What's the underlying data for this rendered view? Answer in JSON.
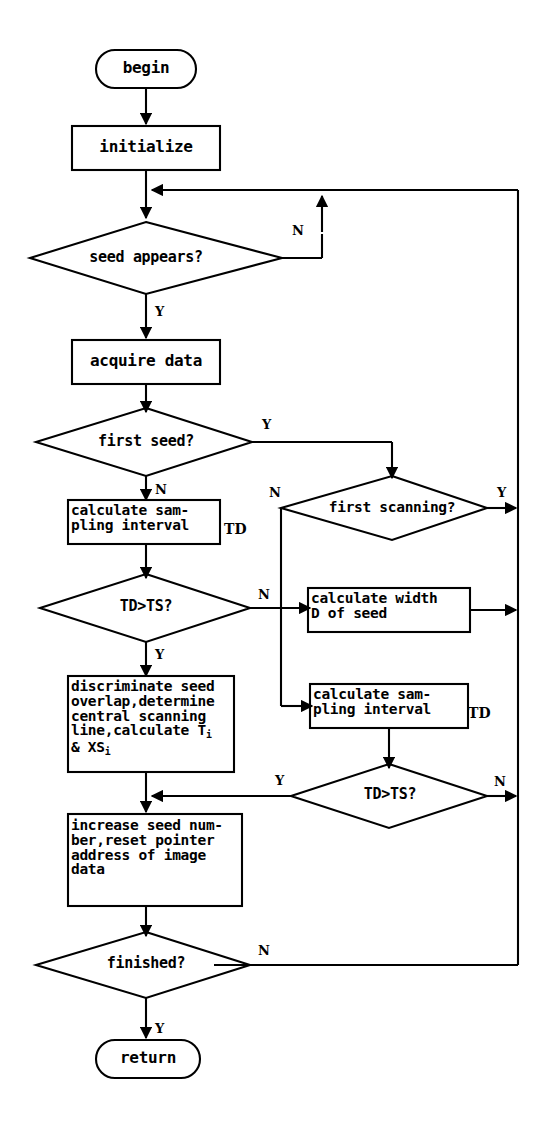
{
  "diagram": {
    "line_color": "#000000",
    "background": "#ffffff",
    "nodes": [
      {
        "id": "begin",
        "shape": "terminal",
        "text": "begin"
      },
      {
        "id": "initialize",
        "shape": "process",
        "text": "initialize"
      },
      {
        "id": "seed_appears",
        "shape": "decision",
        "text": "seed appears?"
      },
      {
        "id": "acquire",
        "shape": "process",
        "text": "acquire data"
      },
      {
        "id": "first_seed",
        "shape": "decision",
        "text": "first seed?"
      },
      {
        "id": "calc_samp_1",
        "shape": "process",
        "text": "calculate sam-\npling interval",
        "suffix": "TD"
      },
      {
        "id": "first_scan",
        "shape": "decision",
        "text": "first scanning?"
      },
      {
        "id": "td_ts_1",
        "shape": "decision",
        "text": "TD>TS?"
      },
      {
        "id": "calc_width",
        "shape": "process",
        "text": "calculate width\nD of seed"
      },
      {
        "id": "calc_samp_2",
        "shape": "process",
        "text": "calculate sam-\npling interval",
        "suffix": "TD"
      },
      {
        "id": "discriminate",
        "shape": "process",
        "text": "discriminate seed\noverlap,determine\ncentral scanning\nline,calculate T",
        "sub1": "i",
        "text2": "& XS",
        "sub2": "i"
      },
      {
        "id": "td_ts_2",
        "shape": "decision",
        "text": "TD>TS?"
      },
      {
        "id": "increase",
        "shape": "process",
        "text": "increase seed num-\nber,reset pointer\naddress of image\ndata"
      },
      {
        "id": "finished",
        "shape": "decision",
        "text": "finished?"
      },
      {
        "id": "return",
        "shape": "terminal",
        "text": "return"
      }
    ],
    "edge_labels": [
      {
        "id": "seed-appears-n",
        "text": "N"
      },
      {
        "id": "seed-appears-y",
        "text": "Y"
      },
      {
        "id": "first-seed-y",
        "text": "Y"
      },
      {
        "id": "first-seed-n",
        "text": "N"
      },
      {
        "id": "first-scan-n",
        "text": "N"
      },
      {
        "id": "first-scan-y",
        "text": "Y"
      },
      {
        "id": "td-ts-1-n",
        "text": "N"
      },
      {
        "id": "td-ts-1-y",
        "text": "Y"
      },
      {
        "id": "td-ts-2-y",
        "text": "Y"
      },
      {
        "id": "td-ts-2-n",
        "text": "N"
      },
      {
        "id": "finished-n",
        "text": "N"
      },
      {
        "id": "finished-y",
        "text": "Y"
      }
    ]
  }
}
